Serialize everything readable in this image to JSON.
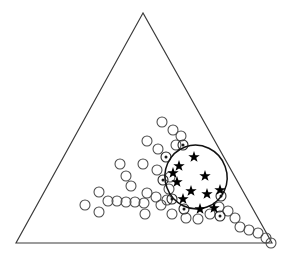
{
  "figure": {
    "title": "",
    "type": "ternary-scatter",
    "background_color": "#ffffff",
    "line_color": "#3a3a3a",
    "marker_colors": {
      "open_circle_stroke": "#4a4a4a",
      "dotted_circle_stroke": "#2a2a2a",
      "star_fill": "#000000",
      "ellipse_stroke": "#111111"
    },
    "canvas": {
      "width": 290,
      "height": 260
    }
  },
  "chart_data": {
    "type": "scatter",
    "title": "",
    "xlabel": "",
    "ylabel": "",
    "xlim": [
      0,
      290
    ],
    "ylim": [
      0,
      260
    ],
    "grid": false,
    "legend_position": "none",
    "annotations": [
      {
        "name": "ternary-triangle",
        "shape": "triangle",
        "vertices": [
          {
            "x": 143,
            "y": 13
          },
          {
            "x": 16,
            "y": 243
          },
          {
            "x": 272,
            "y": 243
          }
        ]
      },
      {
        "name": "cluster-ellipse",
        "shape": "ellipse",
        "cx": 196,
        "cy": 177,
        "rx": 31,
        "ry": 32,
        "rotation_deg": -20
      }
    ],
    "series": [
      {
        "name": "open-circles",
        "marker": "open-circle",
        "marker_radius": 5,
        "count": 38,
        "points": [
          {
            "x": 162,
            "y": 122
          },
          {
            "x": 173,
            "y": 130
          },
          {
            "x": 181,
            "y": 136
          },
          {
            "x": 147,
            "y": 141
          },
          {
            "x": 158,
            "y": 149
          },
          {
            "x": 143,
            "y": 164
          },
          {
            "x": 157,
            "y": 170
          },
          {
            "x": 120,
            "y": 164
          },
          {
            "x": 126,
            "y": 176
          },
          {
            "x": 131,
            "y": 186
          },
          {
            "x": 99,
            "y": 192
          },
          {
            "x": 108,
            "y": 201
          },
          {
            "x": 117,
            "y": 201
          },
          {
            "x": 126,
            "y": 202
          },
          {
            "x": 135,
            "y": 202
          },
          {
            "x": 144,
            "y": 203
          },
          {
            "x": 147,
            "y": 193
          },
          {
            "x": 156,
            "y": 197
          },
          {
            "x": 145,
            "y": 214
          },
          {
            "x": 85,
            "y": 205
          },
          {
            "x": 99,
            "y": 212
          },
          {
            "x": 161,
            "y": 205
          },
          {
            "x": 167,
            "y": 200
          },
          {
            "x": 169,
            "y": 189
          },
          {
            "x": 170,
            "y": 177
          },
          {
            "x": 172,
            "y": 214
          },
          {
            "x": 186,
            "y": 218
          },
          {
            "x": 198,
            "y": 219
          },
          {
            "x": 210,
            "y": 214
          },
          {
            "x": 219,
            "y": 207
          },
          {
            "x": 228,
            "y": 211
          },
          {
            "x": 235,
            "y": 218
          },
          {
            "x": 240,
            "y": 227
          },
          {
            "x": 249,
            "y": 230
          },
          {
            "x": 258,
            "y": 233
          },
          {
            "x": 266,
            "y": 238
          },
          {
            "x": 271,
            "y": 243
          },
          {
            "x": 176,
            "y": 145
          }
        ]
      },
      {
        "name": "dotted-circles",
        "marker": "circle-with-center-dot",
        "marker_radius": 5,
        "count": 7,
        "points": [
          {
            "x": 183,
            "y": 145
          },
          {
            "x": 166,
            "y": 157
          },
          {
            "x": 163,
            "y": 180
          },
          {
            "x": 172,
            "y": 199
          },
          {
            "x": 184,
            "y": 209
          },
          {
            "x": 221,
            "y": 196
          },
          {
            "x": 220,
            "y": 216
          }
        ]
      },
      {
        "name": "stars",
        "marker": "filled-star",
        "marker_radius": 6,
        "count": 11,
        "points": [
          {
            "x": 194,
            "y": 157
          },
          {
            "x": 179,
            "y": 166
          },
          {
            "x": 205,
            "y": 176
          },
          {
            "x": 177,
            "y": 182
          },
          {
            "x": 191,
            "y": 191
          },
          {
            "x": 220,
            "y": 190
          },
          {
            "x": 183,
            "y": 199
          },
          {
            "x": 200,
            "y": 209
          },
          {
            "x": 214,
            "y": 208
          },
          {
            "x": 173,
            "y": 173
          },
          {
            "x": 207,
            "y": 194
          }
        ]
      }
    ]
  }
}
